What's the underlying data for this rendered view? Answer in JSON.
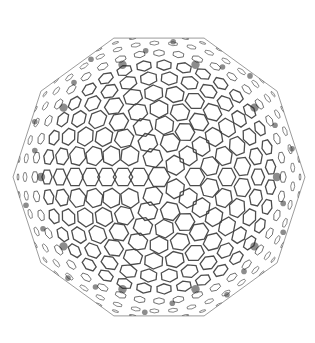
{
  "canvas": {
    "width": 315,
    "height": 343,
    "background": "#ffffff"
  },
  "subject": {
    "label": "fullerene-cage",
    "center": [
      159,
      177
    ],
    "radius": 146,
    "outline_sides": 10,
    "rotation_deg": 0,
    "line_color": "#3a3a3a",
    "node_color": "#2e2e2e",
    "rings": [
      {
        "r": 0,
        "count": 1,
        "cell": 11
      },
      {
        "r": 20,
        "count": 5,
        "cell": 10
      },
      {
        "r": 36,
        "count": 10,
        "cell": 10
      },
      {
        "r": 52,
        "count": 15,
        "cell": 10
      },
      {
        "r": 68,
        "count": 20,
        "cell": 10
      },
      {
        "r": 84,
        "count": 25,
        "cell": 10
      },
      {
        "r": 99,
        "count": 30,
        "cell": 9
      },
      {
        "r": 112,
        "count": 35,
        "cell": 8
      },
      {
        "r": 124,
        "count": 40,
        "cell": 6
      },
      {
        "r": 134,
        "count": 45,
        "cell": 5
      },
      {
        "r": 141,
        "count": 50,
        "cell": 3.5
      }
    ],
    "dark_clusters": {
      "ring_radius": 118,
      "count": 10,
      "size": 7
    }
  }
}
